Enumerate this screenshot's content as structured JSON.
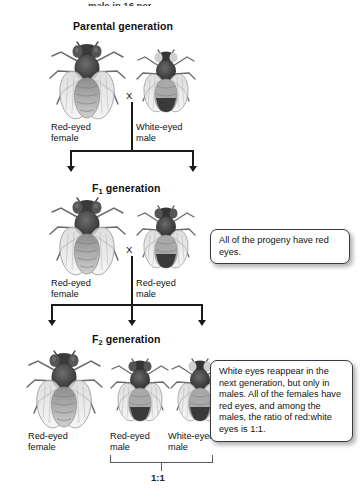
{
  "figure": {
    "cropped_top_text": "male in 16 per",
    "generations": [
      {
        "id": "parental",
        "label": "Parental generation",
        "label_main": "Parental generation",
        "subscript": ""
      },
      {
        "id": "f1",
        "label": "F1 generation",
        "label_main": "F",
        "subscript": "1",
        "label_tail": " generation"
      },
      {
        "id": "f2",
        "label": "F2 generation",
        "label_main": "F",
        "subscript": "2",
        "label_tail": " generation"
      }
    ],
    "cross_symbol": "X",
    "parental": {
      "heading_text": "Parental generation",
      "flies": [
        {
          "name": "parental-female",
          "sex": "female",
          "eye_color": "red",
          "line1": "Red-eyed",
          "line2": "female"
        },
        {
          "name": "parental-male",
          "sex": "male",
          "eye_color": "white",
          "line1": "White-eyed",
          "line2": "male"
        }
      ]
    },
    "f1": {
      "heading_main": "F",
      "heading_sub": "1",
      "heading_tail": " generation",
      "flies": [
        {
          "name": "f1-female",
          "sex": "female",
          "eye_color": "red",
          "line1": "Red-eyed",
          "line2": "female"
        },
        {
          "name": "f1-male",
          "sex": "male",
          "eye_color": "red",
          "line1": "Red-eyed",
          "line2": "male"
        }
      ],
      "callout": "All of the progeny have red eyes."
    },
    "f2": {
      "heading_main": "F",
      "heading_sub": "2",
      "heading_tail": " generation",
      "flies": [
        {
          "name": "f2-female",
          "sex": "female",
          "eye_color": "red",
          "line1": "Red-eyed",
          "line2": "female"
        },
        {
          "name": "f2-male-red",
          "sex": "male",
          "eye_color": "red",
          "line1": "Red-eyed",
          "line2": "male"
        },
        {
          "name": "f2-male-white",
          "sex": "male",
          "eye_color": "white",
          "line1": "White-eyed",
          "line2": "male"
        }
      ],
      "callout": "White eyes reappear in the next generation, but only in males. All of the females have red eyes, and among the males, the ratio of red:white eyes is 1:1.",
      "ratio": "1:1"
    },
    "colors": {
      "ink": "#1a1a1a",
      "bracket": "#5a5a5a",
      "callout_border": "#3a3a3a",
      "background": "#ffffff",
      "red_eye": "#4a4a4a",
      "white_eye": "#d9d9d9"
    }
  }
}
